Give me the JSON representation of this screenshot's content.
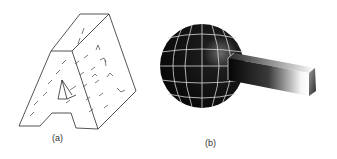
{
  "figure": {
    "panels": [
      {
        "id": "a",
        "label": "(a)",
        "description": "Wireframe 3D extruded letter A with dashed surface vectors"
      },
      {
        "id": "b",
        "label": "(b)",
        "description": "Shaded dark sphere with light gridlines and rectangular bar extending right"
      }
    ],
    "colors": {
      "line": "#222222",
      "sphere": "#0d0d0d",
      "grid": "#d8d8d8",
      "background": "#ffffff"
    }
  }
}
